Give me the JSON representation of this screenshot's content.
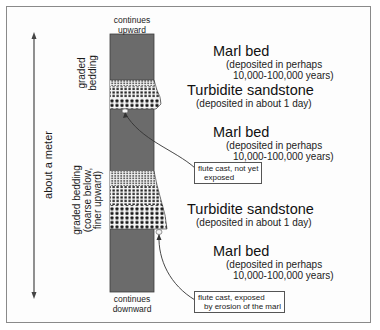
{
  "diagram": {
    "column_top_label": [
      "continues",
      "upward"
    ],
    "column_bottom_label": [
      "continues",
      "downward"
    ],
    "scale_label": "about a meter",
    "left_labels": {
      "upper_graded": [
        "graded",
        "bedding"
      ],
      "lower_graded": [
        "graded bedding",
        "(coarse below,",
        "finer upward)"
      ]
    },
    "layers": [
      {
        "name": "Marl bed",
        "detail": [
          "(deposited in perhaps",
          "10,000-100,000 years)"
        ]
      },
      {
        "name": "Turbidite sandstone",
        "detail": [
          "(deposited in about 1 day)"
        ]
      },
      {
        "name": "Marl bed",
        "detail": [
          "(deposited in perhaps",
          "10,000-100,000 years)"
        ]
      },
      {
        "name": "Turbidite sandstone",
        "detail": [
          "(deposited in about 1 day)"
        ]
      },
      {
        "name": "Marl bed",
        "detail": [
          "(deposited in perhaps",
          "10,000-100,000 years)"
        ]
      }
    ],
    "callouts": [
      {
        "lines": [
          "flute cast, not yet",
          "exposed"
        ]
      },
      {
        "lines": [
          "flute cast, exposed",
          "by erosion of the marl"
        ]
      }
    ],
    "colors": {
      "marl": "#6b6b6b",
      "sandstone_bg": "#f2f2f2",
      "grain": "#222222",
      "frame": "#8a8a8a"
    }
  }
}
